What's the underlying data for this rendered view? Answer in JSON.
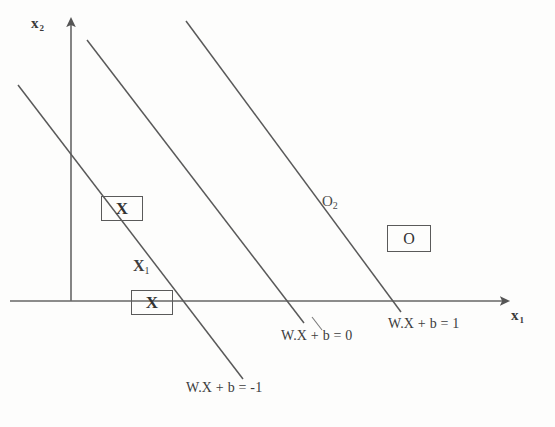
{
  "figure": {
    "background_color": "#fdfdfc",
    "ink_color": "#4a4a4a"
  },
  "axes": {
    "x_label": "x",
    "x_label_sub": "1",
    "y_label": "x",
    "y_label_sub": "2",
    "origin": {
      "x": 71,
      "y": 301
    }
  },
  "lines": [
    {
      "name": "lower-margin-line",
      "equation_label": "W.X  + b = -1",
      "x1": 18,
      "y1": 85,
      "x2": 243,
      "y2": 379
    },
    {
      "name": "decision-boundary-line",
      "equation_label": "W.X  + b = 0",
      "x1": 87,
      "y1": 40,
      "x2": 304,
      "y2": 323
    },
    {
      "name": "upper-margin-line",
      "equation_label": "W.X  + b = 1",
      "x1": 186,
      "y1": 21,
      "x2": 401,
      "y2": 312
    }
  ],
  "points": [
    {
      "name": "support-vector-x-upper",
      "glyph": "X",
      "boxed": true,
      "x": 101,
      "y": 196
    },
    {
      "name": "support-vector-x-lower",
      "glyph": "X",
      "boxed": true,
      "x": 131,
      "y": 290,
      "annotation": "X",
      "annotation_sub": "1"
    },
    {
      "name": "class-o-point",
      "glyph": "O",
      "boxed": true,
      "x": 387,
      "y": 225,
      "annotation": "O",
      "annotation_sub": "2"
    }
  ],
  "annotations": {
    "x1_label": "X",
    "x1_label_sub": "1",
    "o2_label": "O",
    "o2_label_sub": "2"
  }
}
